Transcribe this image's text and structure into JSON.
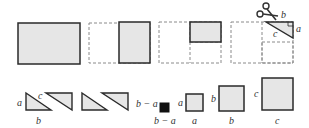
{
  "diagram": {
    "colors": {
      "fill": "#e6e6e6",
      "stroke": "#2a2a2a",
      "dashed": "#8a8a8a",
      "black_square": "#111111"
    },
    "top_row": {
      "panel4_labels": {
        "b": "b",
        "c": "c",
        "a": "a"
      }
    },
    "bottom_row": {
      "triangle_labels": {
        "a": "a",
        "b": "b",
        "c": "c"
      },
      "gap_label": "b − a",
      "small_square": {
        "side_label": "b − a",
        "bottom_label": "b − a"
      },
      "square_a": {
        "side_label": "a",
        "bottom_label": "a"
      },
      "square_b": {
        "side_label": "b",
        "bottom_label": "b"
      },
      "square_c": {
        "side_label": "c",
        "bottom_label": "c"
      }
    }
  }
}
